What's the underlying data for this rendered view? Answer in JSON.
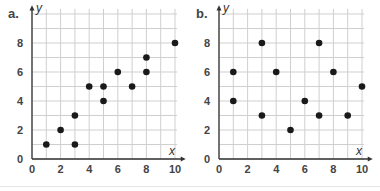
{
  "chart_data": [
    {
      "type": "scatter",
      "panel_label": "a.",
      "title": "",
      "xlabel": "x",
      "ylabel": "y",
      "xlim": [
        0,
        10
      ],
      "ylim": [
        0,
        10
      ],
      "x_ticks": [
        0,
        2,
        4,
        6,
        8,
        10
      ],
      "y_ticks": [
        0,
        2,
        4,
        6,
        8
      ],
      "grid": true,
      "grid_step": 1,
      "legend": null,
      "points": [
        [
          1,
          1
        ],
        [
          2,
          2
        ],
        [
          3,
          1
        ],
        [
          3,
          3
        ],
        [
          4,
          5
        ],
        [
          5,
          5
        ],
        [
          5,
          4
        ],
        [
          6,
          6
        ],
        [
          7,
          5
        ],
        [
          8,
          7
        ],
        [
          8,
          6
        ],
        [
          10,
          8
        ]
      ],
      "x": [
        1,
        2,
        3,
        3,
        4,
        5,
        5,
        6,
        7,
        8,
        8,
        10
      ],
      "y": [
        1,
        2,
        1,
        3,
        5,
        5,
        4,
        6,
        5,
        7,
        6,
        8
      ]
    },
    {
      "type": "scatter",
      "panel_label": "b.",
      "title": "",
      "xlabel": "x",
      "ylabel": "y",
      "xlim": [
        0,
        10
      ],
      "ylim": [
        0,
        10
      ],
      "x_ticks": [
        0,
        2,
        4,
        6,
        8,
        10
      ],
      "y_ticks": [
        0,
        2,
        4,
        6,
        8
      ],
      "grid": true,
      "grid_step": 1,
      "legend": null,
      "points": [
        [
          1,
          6
        ],
        [
          1,
          4
        ],
        [
          3,
          8
        ],
        [
          3,
          3
        ],
        [
          4,
          6
        ],
        [
          5,
          2
        ],
        [
          6,
          4
        ],
        [
          7,
          8
        ],
        [
          7,
          3
        ],
        [
          8,
          6
        ],
        [
          9,
          3
        ],
        [
          10,
          5
        ]
      ],
      "x": [
        1,
        1,
        3,
        3,
        4,
        5,
        6,
        7,
        7,
        8,
        9,
        10
      ],
      "y": [
        6,
        4,
        8,
        3,
        6,
        2,
        4,
        8,
        3,
        6,
        3,
        5
      ]
    }
  ],
  "colors": {
    "grid": "#cfcfcf",
    "axis": "#333333",
    "point": "#1a1a1a",
    "tick_text": "#444444"
  }
}
